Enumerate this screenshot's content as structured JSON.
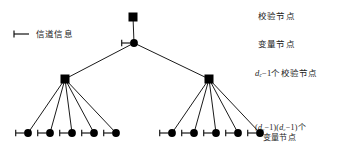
{
  "figure": {
    "type": "tree-diagram"
  },
  "legend": {
    "icon": "half-edge-icon",
    "label": "信道信息"
  },
  "annotations": {
    "check_node": "校验节点",
    "variable_node": "变量节点",
    "dc_minus_one_check": {
      "prefix_var": "d",
      "prefix_sub": "c",
      "suffix": "−1个校验节点"
    },
    "leaf_count": {
      "line1_a_open": "(",
      "line1_a_var": "d",
      "line1_a_sub": "v",
      "line1_a_close": "−1)",
      "line1_b_open": "(",
      "line1_b_var": "d",
      "line1_b_sub": "c",
      "line1_b_close": "−1)个",
      "line2": "变量节点"
    }
  },
  "graph": {
    "colors": {
      "node": "#000000",
      "edge": "#1a1a1a",
      "background": "#ffffff"
    },
    "nodes": [
      {
        "id": "root-check",
        "kind": "check",
        "x": 133,
        "y": 17,
        "half_edge": false
      },
      {
        "id": "root-var",
        "kind": "variable",
        "x": 134,
        "y": 43,
        "half_edge": true
      },
      {
        "id": "check-left",
        "kind": "check",
        "x": 65,
        "y": 79,
        "half_edge": false
      },
      {
        "id": "check-right",
        "kind": "check",
        "x": 209,
        "y": 79,
        "half_edge": false
      },
      {
        "id": "leaf-l1",
        "kind": "variable",
        "x": 28,
        "y": 133,
        "half_edge": true
      },
      {
        "id": "leaf-l2",
        "kind": "variable",
        "x": 50,
        "y": 133,
        "half_edge": true
      },
      {
        "id": "leaf-l3",
        "kind": "variable",
        "x": 72,
        "y": 133,
        "half_edge": true
      },
      {
        "id": "leaf-l4",
        "kind": "variable",
        "x": 94,
        "y": 133,
        "half_edge": true
      },
      {
        "id": "leaf-l5",
        "kind": "variable",
        "x": 116,
        "y": 133,
        "half_edge": true
      },
      {
        "id": "leaf-r1",
        "kind": "variable",
        "x": 172,
        "y": 133,
        "half_edge": true
      },
      {
        "id": "leaf-r2",
        "kind": "variable",
        "x": 194,
        "y": 133,
        "half_edge": true
      },
      {
        "id": "leaf-r3",
        "kind": "variable",
        "x": 216,
        "y": 133,
        "half_edge": true
      },
      {
        "id": "leaf-r4",
        "kind": "variable",
        "x": 238,
        "y": 133,
        "half_edge": true
      },
      {
        "id": "leaf-r5",
        "kind": "variable",
        "x": 260,
        "y": 133,
        "half_edge": true
      }
    ],
    "edges": [
      [
        "root-check",
        "root-var"
      ],
      [
        "root-var",
        "check-left"
      ],
      [
        "root-var",
        "check-right"
      ],
      [
        "check-left",
        "leaf-l1"
      ],
      [
        "check-left",
        "leaf-l2"
      ],
      [
        "check-left",
        "leaf-l3"
      ],
      [
        "check-left",
        "leaf-l4"
      ],
      [
        "check-left",
        "leaf-l5"
      ],
      [
        "check-right",
        "leaf-r1"
      ],
      [
        "check-right",
        "leaf-r2"
      ],
      [
        "check-right",
        "leaf-r3"
      ],
      [
        "check-right",
        "leaf-r4"
      ],
      [
        "check-right",
        "leaf-r5"
      ]
    ]
  }
}
